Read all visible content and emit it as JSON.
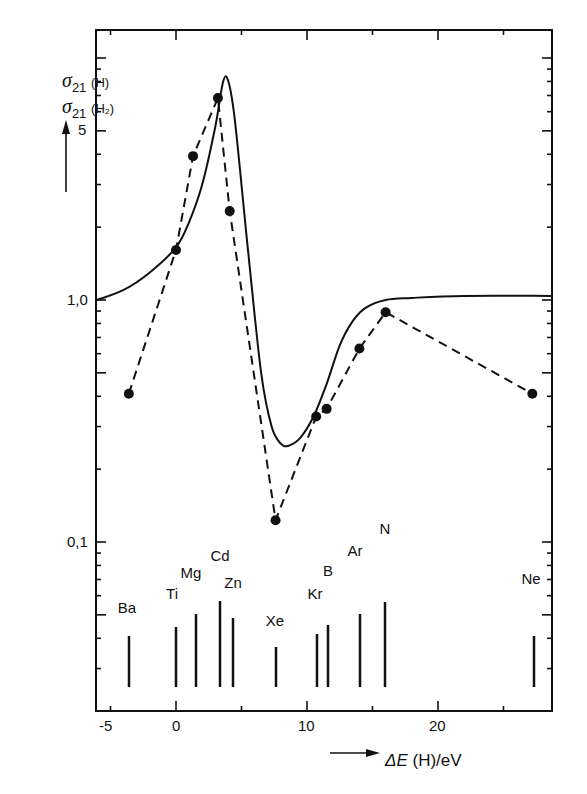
{
  "chart_data": {
    "type": "line",
    "title": "",
    "xlabel": "ΔE (H)/eV",
    "ylabel": "σ21(H) / σ21(H2)",
    "yscale": "log",
    "xlim": [
      -6.2,
      28.9
    ],
    "ylim": [
      0.027,
      12
    ],
    "grid": false,
    "legend": null,
    "x_ticks": [
      -5,
      0,
      10,
      20
    ],
    "x_tick_labels": [
      "-5",
      "0",
      "10",
      "20"
    ],
    "y_tick_labels": [
      "0,1",
      "1,0",
      "5"
    ],
    "y_ticks": [
      0.1,
      1.0,
      5
    ],
    "series": [
      {
        "name": "theory (solid curve)",
        "style": "solid",
        "x": [
          -6.2,
          -4,
          -2,
          0,
          1,
          2,
          3,
          3.6,
          4.0,
          4.5,
          5.5,
          6.5,
          7.3,
          8.0,
          8.6,
          9.5,
          10.5,
          11.5,
          12.5,
          13.5,
          14.5,
          16,
          18,
          22,
          28.9
        ],
        "y": [
          1.0,
          1.1,
          1.3,
          1.65,
          2.1,
          3.0,
          5.2,
          8.0,
          8.0,
          5.5,
          1.6,
          0.5,
          0.3,
          0.255,
          0.25,
          0.27,
          0.33,
          0.45,
          0.65,
          0.82,
          0.93,
          1.0,
          1.02,
          1.04,
          1.04
        ]
      },
      {
        "name": "experiment (dashed with points)",
        "style": "dashed",
        "marker": "filled-circle",
        "x": [
          -3.6,
          0.0,
          1.3,
          3.2,
          4.1,
          7.6,
          10.7,
          11.5,
          14.0,
          16.0,
          27.2
        ],
        "y": [
          0.41,
          1.61,
          3.93,
          6.84,
          2.33,
          0.123,
          0.33,
          0.355,
          0.63,
          0.89,
          0.41
        ]
      }
    ],
    "annotations": {
      "element_lines": [
        {
          "label": "Ba",
          "x": -3.6,
          "height_rel": 0.5
        },
        {
          "label": "Ti",
          "x": 0.0,
          "height_rel": 0.59
        },
        {
          "label": "Mg",
          "x": 1.5,
          "height_rel": 0.72
        },
        {
          "label": "Cd",
          "x": 3.3,
          "height_rel": 0.85
        },
        {
          "label": "Zn",
          "x": 4.3,
          "height_rel": 0.68
        },
        {
          "label": "Xe",
          "x": 7.6,
          "height_rel": 0.39
        },
        {
          "label": "Kr",
          "x": 10.8,
          "height_rel": 0.52
        },
        {
          "label": "B",
          "x": 11.6,
          "height_rel": 0.61
        },
        {
          "label": "Ar",
          "x": 14.0,
          "height_rel": 0.72
        },
        {
          "label": "N",
          "x": 16.0,
          "height_rel": 0.84
        },
        {
          "label": "Ne",
          "x": 27.3,
          "height_rel": 0.5
        }
      ]
    }
  },
  "axes": {
    "y_label_line1": {
      "sym": "σ",
      "sub": "21",
      "paren": "(H)"
    },
    "y_label_line2": {
      "sym": "σ",
      "sub": "21",
      "paren": "(H₂)"
    },
    "y_tick_5": "5",
    "y_tick_1": "1,0",
    "y_tick_01": "0,1",
    "x_tick_m5": "-5",
    "x_tick_0": "0",
    "x_tick_10": "10",
    "x_tick_20": "20",
    "x_label_de": "ΔE",
    "x_label_rest": " (H)/eV"
  },
  "elements": [
    {
      "label": "Ba",
      "lx": 127,
      "ly": 600,
      "x": 129,
      "top": 636
    },
    {
      "label": "Ti",
      "lx": 172,
      "ly": 586,
      "x": 176,
      "top": 627
    },
    {
      "label": "Mg",
      "lx": 191,
      "ly": 565,
      "x": 196,
      "top": 614
    },
    {
      "label": "Cd",
      "lx": 220,
      "ly": 548,
      "x": 220,
      "top": 601
    },
    {
      "label": "Zn",
      "lx": 233,
      "ly": 575,
      "x": 233,
      "top": 618
    },
    {
      "label": "Xe",
      "lx": 275,
      "ly": 613,
      "x": 276,
      "top": 647
    },
    {
      "label": "Kr",
      "lx": 315,
      "ly": 586,
      "x": 317,
      "top": 634
    },
    {
      "label": "B",
      "lx": 328,
      "ly": 563,
      "x": 328,
      "top": 625
    },
    {
      "label": "Ar",
      "lx": 355,
      "ly": 543,
      "x": 360,
      "top": 614
    },
    {
      "label": "N",
      "lx": 385,
      "ly": 521,
      "x": 385,
      "top": 602
    },
    {
      "label": "Ne",
      "lx": 531,
      "ly": 571,
      "x": 534,
      "top": 636
    }
  ]
}
